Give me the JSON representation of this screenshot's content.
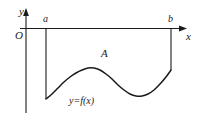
{
  "figure": {
    "stroke_color": "#1a1a1a",
    "background_color": "#ffffff",
    "labels": {
      "y_axis": "y",
      "x_axis": "x",
      "origin": "O",
      "lower_limit": "a",
      "upper_limit": "b",
      "region": "A",
      "curve": "y=f(x)"
    }
  },
  "chart_data": {
    "type": "line",
    "title": "",
    "xlabel": "x",
    "ylabel": "y",
    "grid": false,
    "legend": null,
    "annotations": [
      {
        "text": "a",
        "x": 46,
        "y": 28,
        "role": "lower-limit-tick"
      },
      {
        "text": "b",
        "x": 171,
        "y": 28,
        "role": "upper-limit-tick"
      },
      {
        "text": "A",
        "x": 105,
        "y": 54,
        "role": "region-label"
      },
      {
        "text": "y=f(x)",
        "x": 87,
        "y": 101,
        "role": "curve-label"
      },
      {
        "text": "O",
        "x": 19,
        "y": 34,
        "role": "origin-label"
      }
    ],
    "axes": {
      "x_axis_y_px": 28,
      "y_axis_x_px": 26,
      "x_axis_from_px": 20,
      "x_axis_to_px": 186,
      "y_axis_from_px": 10,
      "y_axis_to_px": 113
    },
    "boundaries": {
      "left_vertical": {
        "x": 46,
        "y_top": 28,
        "y_bottom": 99
      },
      "right_vertical": {
        "x": 171,
        "y_top": 28,
        "y_bottom": 70
      }
    },
    "curve_points_px": [
      [
        46,
        99
      ],
      [
        52,
        94
      ],
      [
        58,
        88
      ],
      [
        64,
        82
      ],
      [
        70,
        77
      ],
      [
        76,
        73
      ],
      [
        82,
        70
      ],
      [
        88,
        68
      ],
      [
        94,
        68
      ],
      [
        100,
        70
      ],
      [
        106,
        74
      ],
      [
        112,
        79
      ],
      [
        118,
        85
      ],
      [
        124,
        90
      ],
      [
        130,
        94
      ],
      [
        136,
        96
      ],
      [
        142,
        96
      ],
      [
        148,
        94
      ],
      [
        154,
        90
      ],
      [
        160,
        84
      ],
      [
        166,
        77
      ],
      [
        171,
        70
      ]
    ]
  }
}
